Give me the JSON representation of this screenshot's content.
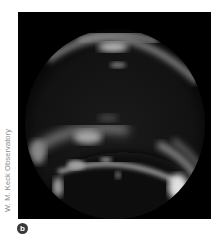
{
  "figure": {
    "credit": "W. M. Keck Observatory",
    "panel_label": "b",
    "colors": {
      "background": "#000000",
      "planet_glow": "#e8e8e8",
      "credit_text": "#8a8a8a",
      "badge_bg": "#3a3a3a"
    }
  }
}
